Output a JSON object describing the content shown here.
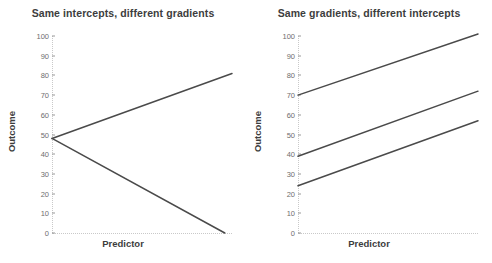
{
  "figure": {
    "background": "#ffffff",
    "line_color": "#4a4a4a",
    "axis_color": "#c9c9c9",
    "tick_text_color": "#6e6e6e",
    "title_color": "#3d3d3d"
  },
  "chart_data": [
    {
      "type": "line",
      "title": "Same intercepts, different gradients",
      "xlabel": "Predictor",
      "ylabel": "Outcome",
      "ylim": [
        0,
        100
      ],
      "yticks": [
        0,
        10,
        20,
        30,
        40,
        50,
        60,
        70,
        80,
        90,
        100
      ],
      "ytick_labels": [
        "0",
        "10",
        "20",
        "30",
        "40",
        "50",
        "60",
        "70",
        "80",
        "90",
        "100"
      ],
      "xlim": [
        0,
        100
      ],
      "xticks": [],
      "grid": false,
      "legend": "none",
      "series": [
        {
          "name": "positive-gradient",
          "x": [
            0,
            100
          ],
          "values": [
            48,
            81
          ]
        },
        {
          "name": "negative-gradient",
          "x": [
            0,
            96
          ],
          "values": [
            48,
            0
          ]
        }
      ]
    },
    {
      "type": "line",
      "title": "Same gradients, different intercepts",
      "xlabel": "Predictor",
      "ylabel": "Outcome",
      "ylim": [
        0,
        100
      ],
      "yticks": [
        0,
        10,
        20,
        30,
        40,
        50,
        60,
        70,
        80,
        90,
        100
      ],
      "ytick_labels": [
        "0",
        "10",
        "20",
        "30",
        "40",
        "50",
        "60",
        "70",
        "80",
        "90",
        "100"
      ],
      "xlim": [
        0,
        100
      ],
      "xticks": [],
      "grid": false,
      "legend": "none",
      "series": [
        {
          "name": "high-intercept",
          "x": [
            0,
            100
          ],
          "values": [
            70,
            101
          ]
        },
        {
          "name": "mid-intercept",
          "x": [
            0,
            100
          ],
          "values": [
            39,
            72
          ]
        },
        {
          "name": "low-intercept",
          "x": [
            0,
            100
          ],
          "values": [
            24,
            57
          ]
        }
      ]
    }
  ]
}
